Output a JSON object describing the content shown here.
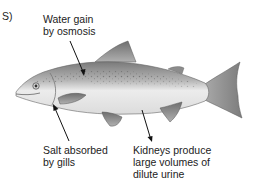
{
  "panel_label": "S)",
  "labels": {
    "water": [
      "Water gain",
      "by osmosis"
    ],
    "salt": [
      "Salt absorbed",
      "by gills"
    ],
    "kidney": [
      "Kidneys produce",
      "large volumes of",
      "dilute urine"
    ]
  },
  "colors": {
    "background": "#ffffff",
    "text": "#222222",
    "arrow": "#111111",
    "fish_back": "#8a8a8a",
    "fish_belly": "#f2f2f2"
  }
}
